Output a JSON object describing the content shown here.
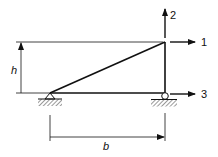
{
  "diagram": {
    "type": "truss-structure",
    "colors": {
      "line": "#111111",
      "hatch": "#555555",
      "background": "#ffffff"
    },
    "dimensions": {
      "height_label": "h",
      "width_label": "b"
    },
    "dofs": [
      {
        "id": "1",
        "label": "1",
        "direction": "horizontal-right",
        "node": "top"
      },
      {
        "id": "2",
        "label": "2",
        "direction": "vertical-up",
        "node": "top"
      },
      {
        "id": "3",
        "label": "3",
        "direction": "horizontal-right",
        "node": "bottom-right"
      }
    ],
    "supports": [
      {
        "type": "pin",
        "node": "bottom-left"
      },
      {
        "type": "roller",
        "node": "bottom-right"
      }
    ]
  }
}
